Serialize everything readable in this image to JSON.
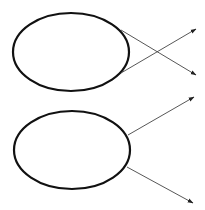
{
  "diagram": {
    "background": "#ffffff",
    "stroke_color": "#111111",
    "line_color": "#444444",
    "ellipses": [
      {
        "name": "top-ellipse",
        "cx": 71,
        "cy": 52,
        "rx": 58,
        "ry": 39,
        "stroke_width": 2.2
      },
      {
        "name": "bottom-ellipse",
        "cx": 72,
        "cy": 150,
        "rx": 58,
        "ry": 39,
        "stroke_width": 2.2
      }
    ],
    "arrows": [
      {
        "name": "top-cross-arrow-1",
        "x1": 121,
        "y1": 30,
        "x2": 196,
        "y2": 75
      },
      {
        "name": "top-cross-arrow-2",
        "x1": 121,
        "y1": 73,
        "x2": 196,
        "y2": 29
      },
      {
        "name": "bottom-arrow-up",
        "x1": 128,
        "y1": 135,
        "x2": 194,
        "y2": 97
      },
      {
        "name": "bottom-arrow-down",
        "x1": 127,
        "y1": 167,
        "x2": 193,
        "y2": 203
      }
    ]
  }
}
